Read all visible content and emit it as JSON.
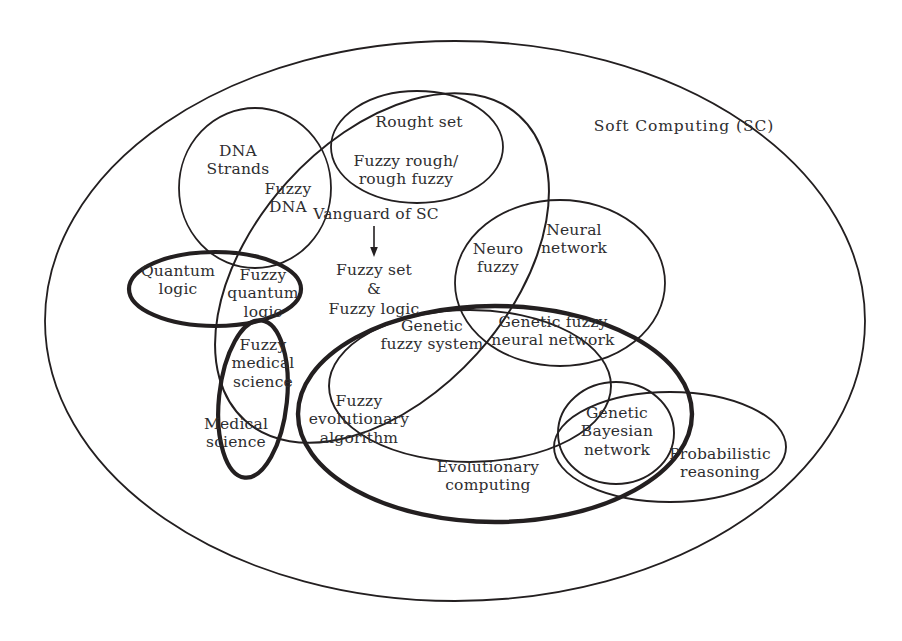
{
  "diagram": {
    "title": "Soft Computing (SC)",
    "outer_region_label": "Soft Computing (SC)",
    "stroke_color": "#231f20",
    "text_color": "#2e2e30",
    "background_color": "#ffffff",
    "annotation": {
      "vanguard_label": "Vanguard of SC",
      "arrow": "down-arrow",
      "target_line1": "Fuzzy set",
      "target_amp": "&",
      "target_line2": "Fuzzy logic"
    },
    "regions": [
      {
        "id": "soft-computing",
        "label": "Soft Computing (SC)",
        "x": 684,
        "y": 126,
        "weight": "thin"
      },
      {
        "id": "dna-strands",
        "label": "DNA\nStrands",
        "x": 238,
        "y": 160,
        "weight": "thin"
      },
      {
        "id": "fuzzy-dna",
        "label": "Fuzzy\nDNA",
        "x": 286,
        "y": 196,
        "weight": "thin"
      },
      {
        "id": "rough-set",
        "label": "Rought set",
        "x": 417,
        "y": 122,
        "weight": "thin"
      },
      {
        "id": "fuzzy-rough",
        "label": "Fuzzy rough/\nrough fuzzy",
        "x": 406,
        "y": 170,
        "weight": "thin"
      },
      {
        "id": "neural-network",
        "label": "Neural\nnetwork",
        "x": 573,
        "y": 238,
        "weight": "thin"
      },
      {
        "id": "neuro-fuzzy",
        "label": "Neuro\nfuzzy",
        "x": 498,
        "y": 258,
        "weight": "thin"
      },
      {
        "id": "genetic-fuzzy-neural",
        "label": "Genetic fuzzy\nneural network",
        "x": 552,
        "y": 330,
        "weight": "thin"
      },
      {
        "id": "genetic-fuzzy-system",
        "label": "Genetic\nfuzzy system",
        "x": 432,
        "y": 334,
        "weight": "thin"
      },
      {
        "id": "quantum-logic",
        "label": "Quantum\nlogic",
        "x": 178,
        "y": 279,
        "weight": "thick"
      },
      {
        "id": "fuzzy-quantum-logic",
        "label": "Fuzzy\nquantum\nlogic",
        "x": 262,
        "y": 292,
        "weight": "thin"
      },
      {
        "id": "fuzzy-medical-science",
        "label": "Fuzzy\nmedical\nscience",
        "x": 262,
        "y": 362,
        "weight": "thin"
      },
      {
        "id": "medical-science",
        "label": "Medical\nscience",
        "x": 236,
        "y": 432,
        "weight": "thick"
      },
      {
        "id": "fuzzy-evolutionary",
        "label": "Fuzzy\nevolutionary\nalgorithm",
        "x": 358,
        "y": 418,
        "weight": "thin"
      },
      {
        "id": "evolutionary-computing",
        "label": "Evolutionary\ncomputing",
        "x": 487,
        "y": 475,
        "weight": "thick"
      },
      {
        "id": "genetic-bayesian-network",
        "label": "Genetic\nBayesian\nnetwork",
        "x": 617,
        "y": 430,
        "weight": "thin"
      },
      {
        "id": "probabilistic-reasoning",
        "label": "Probabilistic\nreasoning",
        "x": 719,
        "y": 462,
        "weight": "thin"
      }
    ],
    "shapes": [
      {
        "id": "outer-soft-computing-ellipse",
        "type": "ellipse",
        "cx": 455,
        "cy": 321,
        "rx": 410,
        "ry": 280,
        "rotate": 0,
        "weight": "thin"
      },
      {
        "id": "dna-strands-ellipse",
        "type": "ellipse",
        "cx": 255,
        "cy": 188,
        "rx": 76,
        "ry": 80,
        "rotate": 0,
        "weight": "thin"
      },
      {
        "id": "rough-set-ellipse",
        "type": "ellipse",
        "cx": 417,
        "cy": 147,
        "rx": 86,
        "ry": 56,
        "rotate": 0,
        "weight": "thin"
      },
      {
        "id": "neural-network-ellipse",
        "type": "ellipse",
        "cx": 560,
        "cy": 283,
        "rx": 105,
        "ry": 83,
        "rotate": 0,
        "weight": "thin"
      },
      {
        "id": "fuzzy-set-logic-ellipse",
        "type": "ellipse",
        "cx": 380,
        "cy": 265,
        "rx": 200,
        "ry": 135,
        "rotate": -42,
        "weight": "thin"
      },
      {
        "id": "quantum-logic-ellipse",
        "type": "ellipse",
        "cx": 215,
        "cy": 289,
        "rx": 85,
        "ry": 37,
        "rotate": 0,
        "weight": "thick"
      },
      {
        "id": "medical-science-ellipse",
        "type": "ellipse",
        "cx": 253,
        "cy": 399,
        "rx": 36,
        "ry": 80,
        "rotate": 5,
        "weight": "thick"
      },
      {
        "id": "evolutionary-computing-ellipse",
        "type": "ellipse",
        "cx": 495,
        "cy": 414,
        "rx": 196,
        "ry": 107,
        "rotate": 0,
        "weight": "thick"
      },
      {
        "id": "genetic-fuzzy-system-ellipse",
        "type": "ellipse",
        "cx": 470,
        "cy": 386,
        "rx": 140,
        "ry": 76,
        "rotate": 0,
        "weight": "thin"
      },
      {
        "id": "probabilistic-reasoning-ellipse",
        "type": "ellipse",
        "cx": 670,
        "cy": 447,
        "rx": 115,
        "ry": 55,
        "rotate": 0,
        "weight": "thin"
      },
      {
        "id": "genetic-bayesian-ellipse",
        "type": "ellipse",
        "cx": 616,
        "cy": 433,
        "rx": 58,
        "ry": 50,
        "rotate": 0,
        "weight": "thin"
      }
    ],
    "stroke_widths": {
      "thin": 1.7,
      "thick": 4.2
    }
  }
}
